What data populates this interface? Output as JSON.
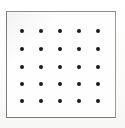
{
  "figure": {
    "caption": "",
    "background_color": "#fdfdfc",
    "frame": {
      "border_color": "#8b8b8b",
      "border_width_px": 1,
      "left_px": 6,
      "top_px": 11,
      "width_px": 110,
      "height_px": 107,
      "fill_color": "#fefefe"
    },
    "dots": {
      "color": "#1b1b1b",
      "shape": "circle",
      "diameter_px": 4,
      "rows": 5,
      "columns": 5,
      "count": 25,
      "x_positions_px": [
        16,
        35,
        54,
        73,
        92
      ],
      "y_positions_px": [
        20,
        38,
        56,
        73,
        90
      ],
      "x_spacing_px": 19,
      "y_spacing_px": 18
    }
  },
  "chart_data": {
    "type": "scatter",
    "xlabel": "",
    "ylabel": "",
    "grid": false,
    "legend": null,
    "series": [
      {
        "name": "lattice points",
        "marker": "filled-circle",
        "color": "#1b1b1b",
        "x": [
          1,
          2,
          3,
          4,
          5,
          1,
          2,
          3,
          4,
          5,
          1,
          2,
          3,
          4,
          5,
          1,
          2,
          3,
          4,
          5,
          1,
          2,
          3,
          4,
          5
        ],
        "y": [
          5,
          5,
          5,
          5,
          5,
          4,
          4,
          4,
          4,
          4,
          3,
          3,
          3,
          3,
          3,
          2,
          2,
          2,
          2,
          2,
          1,
          1,
          1,
          1,
          1
        ]
      }
    ],
    "xlim": [
      0,
      6
    ],
    "ylim": [
      0,
      6
    ]
  }
}
